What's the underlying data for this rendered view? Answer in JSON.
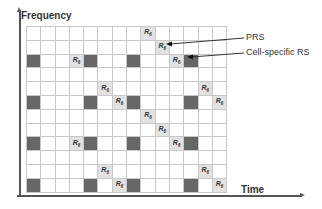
{
  "axes": {
    "y_label": "Frequency",
    "x_label": "Time"
  },
  "grid": {
    "rows": 12,
    "cols": 14,
    "symbol": "R",
    "symbol_sub": "6",
    "colors": {
      "crs": "#666666",
      "prs": "#e2e2e2",
      "empty": "#ffffff",
      "line": "#c8c8c8"
    },
    "crs_cells": [
      [
        2,
        0
      ],
      [
        2,
        4
      ],
      [
        2,
        7
      ],
      [
        2,
        11
      ],
      [
        5,
        0
      ],
      [
        5,
        4
      ],
      [
        5,
        7
      ],
      [
        5,
        11
      ],
      [
        8,
        0
      ],
      [
        8,
        4
      ],
      [
        8,
        7
      ],
      [
        8,
        11
      ],
      [
        11,
        0
      ],
      [
        11,
        4
      ],
      [
        11,
        7
      ],
      [
        11,
        11
      ]
    ],
    "prs_cells": [
      [
        0,
        8
      ],
      [
        1,
        9
      ],
      [
        2,
        3
      ],
      [
        2,
        10
      ],
      [
        4,
        5
      ],
      [
        4,
        12
      ],
      [
        5,
        6
      ],
      [
        5,
        13
      ],
      [
        6,
        8
      ],
      [
        7,
        9
      ],
      [
        8,
        3
      ],
      [
        8,
        10
      ],
      [
        10,
        5
      ],
      [
        10,
        12
      ],
      [
        11,
        6
      ],
      [
        11,
        13
      ]
    ]
  },
  "legend": {
    "prs_label": "PRS",
    "crs_label": "Cell-specific RS"
  }
}
